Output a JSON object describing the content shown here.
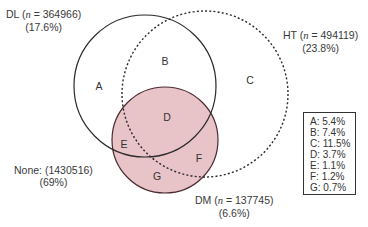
{
  "sets": {
    "DL": {
      "name": "DL",
      "n": "364966",
      "pct": "(17.6%)"
    },
    "HT": {
      "name": "HT",
      "n": "494119",
      "pct": "(23.8%)"
    },
    "DM": {
      "name": "DM",
      "n": "137745",
      "pct": "(6.6%)"
    },
    "none": {
      "label": "None: (1430516)",
      "pct": "(69%)"
    }
  },
  "n_symbol": "n",
  "regions": {
    "A": "A",
    "B": "B",
    "C": "C",
    "D": "D",
    "E": "E",
    "F": "F",
    "G": "G"
  },
  "legend": [
    "A: 5.4%",
    "B: 7.4%",
    "C: 11.5%",
    "D: 3.7%",
    "E: 1.1%",
    "F: 1.2%",
    "G: 0.7%"
  ],
  "colors": {
    "dm_fill": "#e8c3c8",
    "dm_stroke": "#5a2a33",
    "line": "#2a2a2a"
  }
}
